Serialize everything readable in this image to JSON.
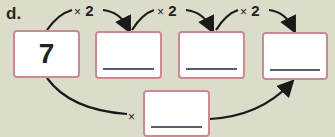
{
  "exercise": {
    "label": "d.",
    "start_value": "7",
    "top_operations": [
      {
        "symbol": "×",
        "operand": "2"
      },
      {
        "symbol": "×",
        "operand": "2"
      },
      {
        "symbol": "×",
        "operand": "2"
      }
    ],
    "bottom_operation": {
      "symbol": "×",
      "operand": ""
    },
    "boxes": [
      {
        "value": "7"
      },
      {
        "value": ""
      },
      {
        "value": ""
      },
      {
        "value": ""
      },
      {
        "value": ""
      }
    ]
  }
}
